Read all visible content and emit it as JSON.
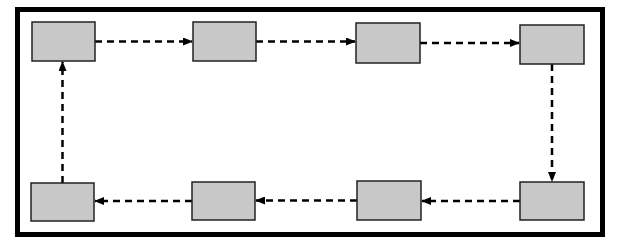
{
  "diagram": {
    "type": "cycle-flow",
    "colors": {
      "frame": "#000000",
      "box_fill": "#c8c8c8",
      "box_stroke": "#222222",
      "arrow": "#000000",
      "background": "#ffffff"
    },
    "nodes": [
      {
        "id": "n1",
        "label": "",
        "x": 32,
        "y": 22,
        "w": 63,
        "h": 39
      },
      {
        "id": "n2",
        "label": "",
        "x": 193,
        "y": 22,
        "w": 63,
        "h": 39
      },
      {
        "id": "n3",
        "label": "",
        "x": 356,
        "y": 23,
        "w": 64,
        "h": 40
      },
      {
        "id": "n4",
        "label": "",
        "x": 520,
        "y": 25,
        "w": 64,
        "h": 39
      },
      {
        "id": "n5",
        "label": "",
        "x": 520,
        "y": 182,
        "w": 64,
        "h": 38
      },
      {
        "id": "n6",
        "label": "",
        "x": 357,
        "y": 181,
        "w": 64,
        "h": 39
      },
      {
        "id": "n7",
        "label": "",
        "x": 192,
        "y": 182,
        "w": 63,
        "h": 38
      },
      {
        "id": "n8",
        "label": "",
        "x": 31,
        "y": 183,
        "w": 63,
        "h": 38
      }
    ],
    "edges": [
      {
        "from": "n1",
        "to": "n2",
        "style": "dashed"
      },
      {
        "from": "n2",
        "to": "n3",
        "style": "dashed"
      },
      {
        "from": "n3",
        "to": "n4",
        "style": "dashed"
      },
      {
        "from": "n4",
        "to": "n5",
        "style": "dashed"
      },
      {
        "from": "n5",
        "to": "n6",
        "style": "dashed"
      },
      {
        "from": "n6",
        "to": "n7",
        "style": "dashed"
      },
      {
        "from": "n7",
        "to": "n8",
        "style": "dashed"
      },
      {
        "from": "n8",
        "to": "n1",
        "style": "dashed"
      }
    ]
  }
}
